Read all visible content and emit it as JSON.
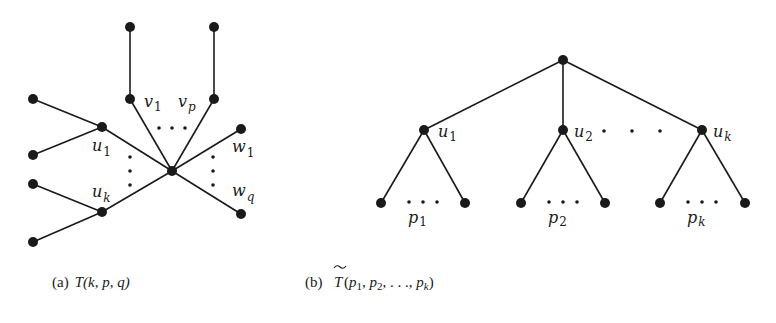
{
  "figure_a": {
    "caption_prefix": "(a)",
    "caption_math": "T(k, p, q)",
    "labels": {
      "v1": {
        "base": "v",
        "sub": "1"
      },
      "vp": {
        "base": "v",
        "sub": "p"
      },
      "u1": {
        "base": "u",
        "sub": "1"
      },
      "uk": {
        "base": "u",
        "sub": "k"
      },
      "w1": {
        "base": "w",
        "sub": "1"
      },
      "wq": {
        "base": "w",
        "sub": "q"
      }
    }
  },
  "figure_b": {
    "caption_prefix": "(b)",
    "caption_math_base": "T",
    "caption_math_tilde": "~",
    "caption_math_args": "(p1, p2, . . . , pk)",
    "caption_parts": [
      {
        "base": "p",
        "sub": "1"
      },
      {
        "base": "p",
        "sub": "2"
      },
      {
        "text": ". . ."
      },
      {
        "base": "p",
        "sub": "k"
      }
    ],
    "labels": {
      "u1": {
        "base": "u",
        "sub": "1"
      },
      "u2": {
        "base": "u",
        "sub": "2"
      },
      "uk": {
        "base": "u",
        "sub": "k"
      },
      "p1": {
        "base": "p",
        "sub": "1"
      },
      "p2": {
        "base": "p",
        "sub": "2"
      },
      "pk": {
        "base": "p",
        "sub": "k"
      }
    }
  },
  "punct": {
    "open": "(",
    "close": ")",
    "comma": ", "
  }
}
